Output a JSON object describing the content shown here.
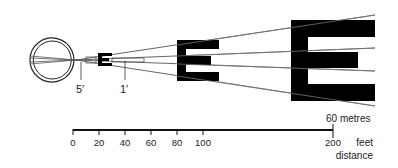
{
  "figure": {
    "type": "visual-acuity-diagram",
    "colors": {
      "ink": "#000000",
      "line": "#555555",
      "background": "#ffffff"
    }
  },
  "angle_labels": {
    "total": "5′",
    "detail": "1′"
  },
  "letters": [
    {
      "glyph": "E",
      "size": "small"
    },
    {
      "glyph": "E",
      "size": "medium"
    },
    {
      "glyph": "E",
      "size": "large"
    }
  ],
  "scale": {
    "metres_label": "60 metres",
    "feet_unit": "feet",
    "axis_title": "distance",
    "ticks": [
      "0",
      "20",
      "40",
      "60",
      "80",
      "100"
    ],
    "end_tick": "200"
  }
}
